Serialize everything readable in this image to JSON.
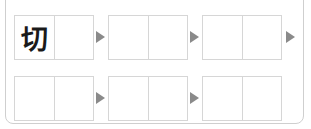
{
  "puzzle": {
    "rows": [
      {
        "words": [
          {
            "cells": [
              "切",
              ""
            ]
          },
          {
            "cells": [
              "",
              ""
            ]
          },
          {
            "cells": [
              "",
              ""
            ]
          }
        ],
        "trailing_arrow": true
      },
      {
        "words": [
          {
            "cells": [
              "",
              ""
            ]
          },
          {
            "cells": [
              "",
              ""
            ]
          },
          {
            "cells": [
              "",
              ""
            ]
          }
        ],
        "trailing_arrow": false
      }
    ],
    "colors": {
      "border": "#d6d6d6",
      "frame": "#cfcfcf",
      "arrow": "#8a8a8a",
      "text": "#1a1a1a"
    }
  }
}
